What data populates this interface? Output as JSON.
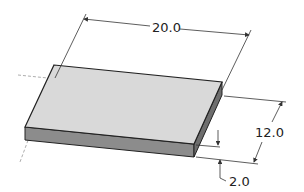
{
  "diagram": {
    "type": "isometric-dimensioned-plate",
    "dimensions": {
      "length": "20.0",
      "width": "12.0",
      "thickness": "2.0"
    },
    "colors": {
      "top_face": "#d9d9d9",
      "front_face": "#8c8c8c",
      "side_face": "#6e6e6e",
      "edge": "#222222",
      "dimension_line": "#333333",
      "hidden_line": "#999999"
    }
  }
}
